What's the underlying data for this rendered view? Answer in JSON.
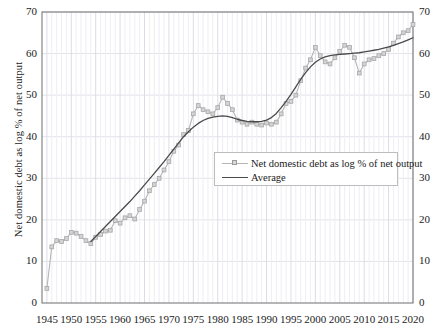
{
  "chart_data": {
    "type": "line",
    "title": "",
    "xlabel": "",
    "ylabel": "Net domestic debt as log % of net output",
    "xlim": [
      1944,
      2020
    ],
    "ylim": [
      0,
      70
    ],
    "yticks": [
      0,
      10,
      20,
      30,
      40,
      50,
      60,
      70
    ],
    "xticks": [
      1945,
      1950,
      1955,
      1960,
      1965,
      1970,
      1975,
      1980,
      1985,
      1990,
      1995,
      2000,
      2005,
      2010,
      2015,
      2020
    ],
    "grid": true,
    "grid_axis": "both",
    "dual_y_axis": true,
    "legend_position": "center-right-inside",
    "series": [
      {
        "name": "Net domestic debt as log % of net output",
        "color": "#b5b5b5",
        "marker": "square",
        "x": [
          1945,
          1946,
          1947,
          1948,
          1949,
          1950,
          1951,
          1952,
          1953,
          1954,
          1955,
          1956,
          1957,
          1958,
          1959,
          1960,
          1961,
          1962,
          1963,
          1964,
          1965,
          1966,
          1967,
          1968,
          1969,
          1970,
          1971,
          1972,
          1973,
          1974,
          1975,
          1976,
          1977,
          1978,
          1979,
          1980,
          1981,
          1982,
          1983,
          1984,
          1985,
          1986,
          1987,
          1988,
          1989,
          1990,
          1991,
          1992,
          1993,
          1994,
          1995,
          1996,
          1997,
          1998,
          1999,
          2000,
          2001,
          2002,
          2003,
          2004,
          2005,
          2006,
          2007,
          2008,
          2009,
          2010,
          2011,
          2012,
          2013,
          2014,
          2015,
          2016,
          2017,
          2018,
          2019,
          2020
        ],
        "values": [
          3.5,
          13.5,
          15.0,
          14.8,
          15.5,
          17.0,
          16.8,
          16.0,
          15.0,
          14.3,
          15.8,
          16.5,
          17.3,
          17.5,
          19.8,
          19.2,
          20.5,
          21.0,
          20.2,
          22.5,
          24.5,
          27.0,
          28.5,
          30.0,
          32.0,
          34.0,
          36.5,
          38.0,
          40.5,
          41.5,
          45.5,
          47.5,
          46.5,
          46.0,
          45.5,
          47.0,
          49.5,
          48.0,
          46.5,
          44.0,
          43.5,
          43.0,
          43.5,
          43.0,
          42.8,
          43.3,
          43.0,
          43.5,
          45.5,
          48.0,
          48.5,
          50.0,
          53.5,
          56.5,
          58.5,
          61.5,
          59.5,
          58.0,
          57.5,
          59.0,
          60.5,
          62.0,
          61.5,
          59.0,
          55.3,
          57.5,
          58.5,
          58.8,
          59.5,
          60.0,
          61.0,
          62.5,
          64.0,
          65.0,
          65.5,
          67.0
        ]
      },
      {
        "name": "Average",
        "color": "#4a4a4a",
        "marker": "none",
        "x": [
          1954,
          1955,
          1956,
          1957,
          1958,
          1959,
          1960,
          1961,
          1962,
          1963,
          1964,
          1965,
          1966,
          1967,
          1968,
          1969,
          1970,
          1971,
          1972,
          1973,
          1974,
          1975,
          1976,
          1977,
          1978,
          1979,
          1980,
          1981,
          1982,
          1983,
          1984,
          1985,
          1986,
          1987,
          1988,
          1989,
          1990,
          1991,
          1992,
          1993,
          1994,
          1995,
          1996,
          1997,
          1998,
          1999,
          2000,
          2001,
          2002,
          2003,
          2004,
          2005,
          2006,
          2007,
          2008,
          2009,
          2010,
          2011,
          2012,
          2013,
          2014,
          2015,
          2016,
          2017,
          2018,
          2019,
          2020
        ],
        "values": [
          14.8,
          16.0,
          17.2,
          18.4,
          19.6,
          20.8,
          22.0,
          23.2,
          24.4,
          25.7,
          27.0,
          28.4,
          29.8,
          31.2,
          32.6,
          34.0,
          35.5,
          37.0,
          38.5,
          40.0,
          41.2,
          42.3,
          43.2,
          43.9,
          44.4,
          44.7,
          44.9,
          45.0,
          44.9,
          44.6,
          44.2,
          43.9,
          43.7,
          43.6,
          43.6,
          43.7,
          44.0,
          44.6,
          45.6,
          47.0,
          48.5,
          50.2,
          52.0,
          53.8,
          55.4,
          56.8,
          57.9,
          58.7,
          59.2,
          59.5,
          59.7,
          59.8,
          59.9,
          60.0,
          60.1,
          60.2,
          60.4,
          60.6,
          60.8,
          61.0,
          61.3,
          61.6,
          62.0,
          62.4,
          62.8,
          63.3,
          63.8
        ]
      }
    ]
  },
  "legend": {
    "items": [
      {
        "label": "Net domestic debt as log % of net output"
      },
      {
        "label": "Average"
      }
    ]
  },
  "colors": {
    "series_main": "#b5b5b5",
    "series_average": "#4a4a4a",
    "grid": "#e2e2ea",
    "axis": "#7a7a7a",
    "text": "#1b1b1b"
  }
}
